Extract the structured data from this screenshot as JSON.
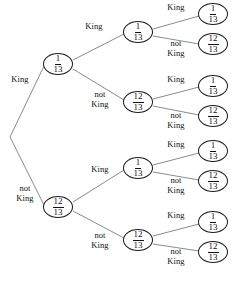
{
  "diagram": {
    "type": "probability-tree",
    "depth": 3,
    "stroke_color": "#7d7d7d",
    "node_border_color": "#1a1a1a",
    "text_color": "#111111",
    "background_color": "#ffffff",
    "labels": {
      "king": "King",
      "not_king": "not\nKing"
    },
    "fractions": {
      "king": {
        "numerator": "1",
        "denominator": "13"
      },
      "not_king": {
        "numerator": "12",
        "denominator": "13"
      }
    },
    "root": {
      "x": 10,
      "y": 137
    },
    "edge_labels": [
      {
        "id": "edge-label-l1-king",
        "text": "King",
        "x": 20,
        "y": 80
      },
      {
        "id": "edge-label-l1-notking",
        "text": "not\nKing",
        "x": 25,
        "y": 193
      },
      {
        "id": "edge-label-l2a-king",
        "text": "King",
        "x": 94,
        "y": 27
      },
      {
        "id": "edge-label-l2a-notking",
        "text": "not\nKing",
        "x": 100,
        "y": 99
      },
      {
        "id": "edge-label-l2b-king",
        "text": "King",
        "x": 100,
        "y": 170
      },
      {
        "id": "edge-label-l2b-notking",
        "text": "not\nKing",
        "x": 100,
        "y": 240
      },
      {
        "id": "edge-label-l3a-king",
        "text": "King",
        "x": 176,
        "y": 8
      },
      {
        "id": "edge-label-l3a-notking",
        "text": "not\nKing",
        "x": 176,
        "y": 48
      },
      {
        "id": "edge-label-l3b-king",
        "text": "King",
        "x": 176,
        "y": 80
      },
      {
        "id": "edge-label-l3b-notking",
        "text": "not\nKing",
        "x": 176,
        "y": 120
      },
      {
        "id": "edge-label-l3c-king",
        "text": "King",
        "x": 176,
        "y": 145
      },
      {
        "id": "edge-label-l3c-notking",
        "text": "not\nKing",
        "x": 176,
        "y": 185
      },
      {
        "id": "edge-label-l3d-king",
        "text": "King",
        "x": 176,
        "y": 216
      },
      {
        "id": "edge-label-l3d-notking",
        "text": "not\nKing",
        "x": 176,
        "y": 256
      }
    ],
    "nodes": [
      {
        "id": "node-l1-king",
        "level": 1,
        "x": 58,
        "y": 64,
        "numerator": "1",
        "denominator": "13"
      },
      {
        "id": "node-l1-notking",
        "level": 1,
        "x": 58,
        "y": 207,
        "numerator": "12",
        "denominator": "13"
      },
      {
        "id": "node-l2-a",
        "level": 2,
        "x": 138,
        "y": 32,
        "numerator": "1",
        "denominator": "13"
      },
      {
        "id": "node-l2-b",
        "level": 2,
        "x": 138,
        "y": 102,
        "numerator": "12",
        "denominator": "13"
      },
      {
        "id": "node-l2-c",
        "level": 2,
        "x": 138,
        "y": 168,
        "numerator": "1",
        "denominator": "13"
      },
      {
        "id": "node-l2-d",
        "level": 2,
        "x": 138,
        "y": 240,
        "numerator": "12",
        "denominator": "13"
      },
      {
        "id": "node-l3-1",
        "level": 3,
        "x": 213,
        "y": 14,
        "numerator": "1",
        "denominator": "13"
      },
      {
        "id": "node-l3-2",
        "level": 3,
        "x": 213,
        "y": 44,
        "numerator": "12",
        "denominator": "13"
      },
      {
        "id": "node-l3-3",
        "level": 3,
        "x": 213,
        "y": 86,
        "numerator": "1",
        "denominator": "13"
      },
      {
        "id": "node-l3-4",
        "level": 3,
        "x": 213,
        "y": 116,
        "numerator": "12",
        "denominator": "13"
      },
      {
        "id": "node-l3-5",
        "level": 3,
        "x": 213,
        "y": 151,
        "numerator": "1",
        "denominator": "13"
      },
      {
        "id": "node-l3-6",
        "level": 3,
        "x": 213,
        "y": 181,
        "numerator": "12",
        "denominator": "13"
      },
      {
        "id": "node-l3-7",
        "level": 3,
        "x": 213,
        "y": 222,
        "numerator": "1",
        "denominator": "13"
      },
      {
        "id": "node-l3-8",
        "level": 3,
        "x": 213,
        "y": 252,
        "numerator": "12",
        "denominator": "13"
      }
    ],
    "edges": [
      {
        "id": "edge-root-king",
        "x1": 10,
        "y1": 137,
        "x2": 44,
        "y2": 66
      },
      {
        "id": "edge-root-notking",
        "x1": 10,
        "y1": 137,
        "x2": 44,
        "y2": 205
      },
      {
        "id": "edge-l1king-a",
        "x1": 73,
        "y1": 60,
        "x2": 124,
        "y2": 34
      },
      {
        "id": "edge-l1king-b",
        "x1": 73,
        "y1": 69,
        "x2": 124,
        "y2": 100
      },
      {
        "id": "edge-l1notking-c",
        "x1": 73,
        "y1": 202,
        "x2": 124,
        "y2": 170
      },
      {
        "id": "edge-l1notking-d",
        "x1": 73,
        "y1": 211,
        "x2": 124,
        "y2": 238
      },
      {
        "id": "edge-l2a-1",
        "x1": 153,
        "y1": 29,
        "x2": 199,
        "y2": 16
      },
      {
        "id": "edge-l2a-2",
        "x1": 153,
        "y1": 36,
        "x2": 199,
        "y2": 44
      },
      {
        "id": "edge-l2b-3",
        "x1": 153,
        "y1": 99,
        "x2": 199,
        "y2": 87
      },
      {
        "id": "edge-l2b-4",
        "x1": 153,
        "y1": 106,
        "x2": 199,
        "y2": 115
      },
      {
        "id": "edge-l2c-5",
        "x1": 153,
        "y1": 165,
        "x2": 199,
        "y2": 153
      },
      {
        "id": "edge-l2c-6",
        "x1": 153,
        "y1": 172,
        "x2": 199,
        "y2": 180
      },
      {
        "id": "edge-l2d-7",
        "x1": 153,
        "y1": 236,
        "x2": 199,
        "y2": 224
      },
      {
        "id": "edge-l2d-8",
        "x1": 153,
        "y1": 244,
        "x2": 199,
        "y2": 251
      }
    ]
  }
}
